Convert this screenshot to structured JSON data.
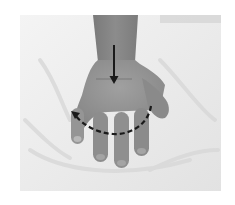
{
  "figure": {
    "colors": {
      "background": "#ffffff",
      "cloth": "#ececec",
      "cloth_shadow": "#d6d6d6",
      "skin": "#8e8e8e",
      "skin_light": "#a2a2a2",
      "skin_dark": "#6f6f6f",
      "arrow": "#1a1a1a"
    },
    "annotations": [
      {
        "type": "straight-arrow",
        "direction": "down",
        "location": "back of hand / wrist"
      },
      {
        "type": "dashed-curved-arrow",
        "direction": "right-to-left",
        "location": "across knuckles"
      }
    ]
  }
}
